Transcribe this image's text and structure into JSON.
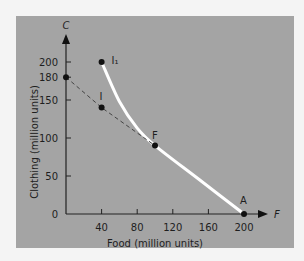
{
  "chart_data": {
    "type": "line",
    "title": "",
    "xlabel": "Food (million units)",
    "ylabel": "Clothing (million units)",
    "x_axis_symbol": "F",
    "y_axis_symbol": "C",
    "xlim": [
      0,
      200
    ],
    "ylim": [
      0,
      200
    ],
    "x_ticks": [
      40,
      80,
      120,
      160,
      200
    ],
    "y_ticks": [
      0,
      50,
      100,
      150,
      180,
      200
    ],
    "grid": false,
    "series": [
      {
        "name": "Production possibilities frontier",
        "style": "solid-white",
        "points": [
          [
            40,
            200
          ],
          [
            60,
            148
          ],
          [
            80,
            113
          ],
          [
            100,
            90
          ],
          [
            150,
            45
          ],
          [
            200,
            0
          ]
        ]
      },
      {
        "name": "Trade line",
        "style": "dashed",
        "points": [
          [
            0,
            180
          ],
          [
            40,
            140
          ],
          [
            100,
            90
          ]
        ]
      }
    ],
    "labeled_points": [
      {
        "label": "I₁",
        "x": 40,
        "y": 200
      },
      {
        "label": "I",
        "x": 40,
        "y": 140
      },
      {
        "label": "F",
        "x": 100,
        "y": 90
      },
      {
        "label": "A",
        "x": 200,
        "y": 0
      },
      {
        "label": "",
        "x": 0,
        "y": 180
      }
    ]
  }
}
